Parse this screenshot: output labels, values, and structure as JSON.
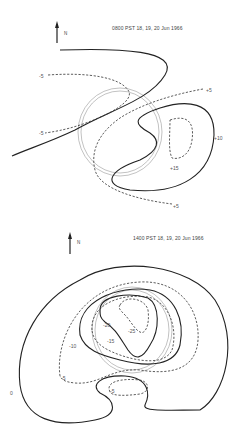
{
  "panels": [
    {
      "title": "0800 PST  18, 19, 20 Jun 1966",
      "north_label": "N",
      "contour_labels": [
        {
          "text": "-5",
          "x": 39,
          "y": 73
        },
        {
          "text": "-5",
          "x": 39,
          "y": 130
        },
        {
          "text": "+5",
          "x": 206,
          "y": 87
        },
        {
          "text": "+10",
          "x": 214,
          "y": 135
        },
        {
          "text": "+15",
          "x": 170,
          "y": 165
        },
        {
          "text": "+5",
          "x": 173,
          "y": 203
        }
      ]
    },
    {
      "title": "1400 PST  18, 19, 20 Jun 1966",
      "north_label": "N",
      "contour_labels": [
        {
          "text": "-20",
          "x": 103,
          "y": 322
        },
        {
          "text": "-25",
          "x": 128,
          "y": 328
        },
        {
          "text": "-15",
          "x": 107,
          "y": 338
        },
        {
          "text": "-10",
          "x": 69,
          "y": 343
        },
        {
          "text": "-5",
          "x": 61,
          "y": 375
        },
        {
          "text": "0",
          "x": 10,
          "y": 390
        },
        {
          "text": "-5",
          "x": 110,
          "y": 388
        }
      ]
    }
  ],
  "legend": {
    "solid_line": "contour",
    "dashed_line": "intermediate contour"
  }
}
